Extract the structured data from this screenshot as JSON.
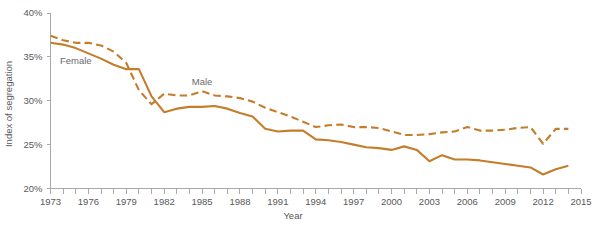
{
  "chart_data": {
    "type": "line",
    "title": "",
    "xlabel": "Year",
    "ylabel": "Index of segregation",
    "xlim": [
      1973,
      2015
    ],
    "ylim": [
      20,
      40
    ],
    "grid": false,
    "legend_position": "inline-annotation",
    "y_ticks": [
      20,
      25,
      30,
      35,
      40
    ],
    "y_tick_labels": [
      "20%",
      "25%",
      "30%",
      "35%",
      "40%"
    ],
    "x_ticks": [
      1973,
      1974,
      1975,
      1976,
      1977,
      1978,
      1979,
      1980,
      1981,
      1982,
      1983,
      1984,
      1985,
      1986,
      1987,
      1988,
      1989,
      1990,
      1991,
      1992,
      1993,
      1994,
      1995,
      1996,
      1997,
      1998,
      1999,
      2000,
      2001,
      2002,
      2003,
      2004,
      2005,
      2006,
      2007,
      2008,
      2009,
      2010,
      2011,
      2012,
      2013,
      2014,
      2015
    ],
    "x_tick_labels": [
      {
        "value": 1973,
        "label": "1973"
      },
      {
        "value": 1976,
        "label": "1976"
      },
      {
        "value": 1979,
        "label": "1979"
      },
      {
        "value": 1982,
        "label": "1982"
      },
      {
        "value": 1985,
        "label": "1985"
      },
      {
        "value": 1988,
        "label": "1988"
      },
      {
        "value": 1991,
        "label": "1991"
      },
      {
        "value": 1994,
        "label": "1994"
      },
      {
        "value": 1997,
        "label": "1997"
      },
      {
        "value": 2000,
        "label": "2000"
      },
      {
        "value": 2003,
        "label": "2003"
      },
      {
        "value": 2006,
        "label": "2006"
      },
      {
        "value": 2009,
        "label": "2009"
      },
      {
        "value": 2012,
        "label": "2012"
      },
      {
        "value": 2015,
        "label": "2015"
      }
    ],
    "x": [
      1973,
      1974,
      1975,
      1976,
      1977,
      1978,
      1979,
      1980,
      1981,
      1982,
      1983,
      1984,
      1985,
      1986,
      1987,
      1988,
      1989,
      1990,
      1991,
      1992,
      1993,
      1994,
      1995,
      1996,
      1997,
      1998,
      1999,
      2000,
      2001,
      2002,
      2003,
      2004,
      2005,
      2006,
      2007,
      2008,
      2009,
      2010,
      2011,
      2012,
      2013,
      2014
    ],
    "series": [
      {
        "name": "Male",
        "style": "dashed",
        "color": "#C47D2B",
        "label": "Male",
        "label_x": 1985.0,
        "label_y": 31.8,
        "values": [
          37.4,
          36.9,
          36.6,
          36.6,
          36.3,
          35.6,
          34.3,
          31.2,
          29.6,
          30.8,
          30.6,
          30.6,
          31.1,
          30.6,
          30.5,
          30.3,
          29.9,
          29.2,
          28.7,
          28.2,
          27.6,
          27.0,
          27.2,
          27.3,
          27.0,
          27.0,
          26.9,
          26.5,
          26.1,
          26.1,
          26.2,
          26.4,
          26.5,
          27.0,
          26.6,
          26.6,
          26.7,
          26.9,
          27.0,
          25.1,
          26.8,
          26.8
        ]
      },
      {
        "name": "Female",
        "style": "solid",
        "color": "#C47D2B",
        "label": "Female",
        "label_x": 1975.0,
        "label_y": 34.2,
        "values": [
          36.6,
          36.4,
          36.0,
          35.4,
          34.8,
          34.1,
          33.6,
          33.6,
          30.5,
          28.7,
          29.1,
          29.3,
          29.3,
          29.4,
          29.1,
          28.6,
          28.2,
          26.8,
          26.5,
          26.6,
          26.6,
          25.6,
          25.5,
          25.3,
          25.0,
          24.7,
          24.6,
          24.4,
          24.8,
          24.4,
          23.1,
          23.8,
          23.3,
          23.3,
          23.2,
          23.0,
          22.8,
          22.6,
          22.4,
          21.6,
          22.2,
          22.6
        ]
      }
    ]
  },
  "axes": {
    "ylabel": "Index of segregation",
    "xlabel": "Year"
  }
}
